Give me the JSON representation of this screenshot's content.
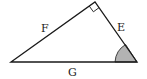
{
  "diagram": {
    "type": "right-triangle",
    "vertices": {
      "left": [
        11,
        62
      ],
      "top": [
        95,
        2
      ],
      "right": [
        137,
        62
      ]
    },
    "sides": {
      "hypotenuse_left": {
        "label": "F",
        "pos": [
          45,
          31
        ]
      },
      "right_side": {
        "label": "E",
        "pos": [
          121,
          30
        ]
      },
      "base": {
        "label": "G",
        "pos": [
          72,
          75
        ]
      }
    },
    "right_angle_marker": {
      "at": "top",
      "size": 7
    },
    "shaded_angle": {
      "at": "right",
      "color": "#b3b3b3"
    },
    "colors": {
      "stroke": "#1a1a1a",
      "fill": "#ffffff",
      "shade": "#b3b3b3"
    }
  }
}
